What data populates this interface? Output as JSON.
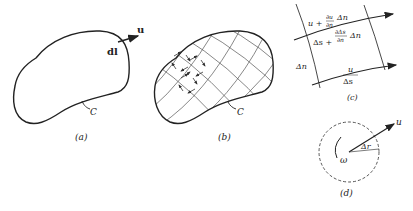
{
  "panels": {
    "a": {
      "caption": "(a)",
      "curve_label": "C",
      "element_label": "dl",
      "vector_label": "u"
    },
    "b": {
      "caption": "(b)",
      "curve_label": "C"
    },
    "c": {
      "caption": "(c)",
      "top_velocity": "u + ∂u/∂n Δn",
      "top_velocity_parts": {
        "u": "u +",
        "frac_num": "∂u",
        "frac_den": "∂n",
        "tail": "Δn"
      },
      "top_length_parts": {
        "s": "Δs +",
        "frac_num": "∂Δs",
        "frac_den": "∂n",
        "tail": "Δn"
      },
      "side_label": "Δn",
      "bottom_velocity": "u",
      "bottom_length": "Δs"
    },
    "d": {
      "caption": "(d)",
      "vector_label": "u",
      "radius_label": "Δr",
      "rotation_label": "ω"
    }
  },
  "colors": {
    "stroke": "#222222",
    "grid": "#555555",
    "background": "#ffffff"
  }
}
